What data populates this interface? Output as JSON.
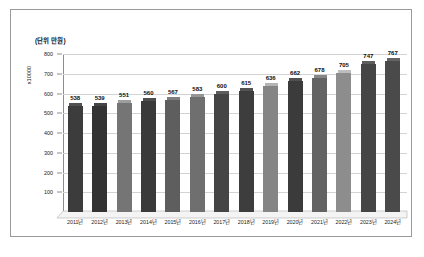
{
  "chart_data": {
    "type": "bar",
    "title": "",
    "unit_caption": "(단위 만원)",
    "ylabel": "x10000",
    "xlabel": "",
    "categories": [
      "2011년",
      "2012년",
      "2013년",
      "2014년",
      "2015년",
      "2016년",
      "2017년",
      "2018년",
      "2019년",
      "2020년",
      "2021년",
      "2022년",
      "2023년",
      "2024년"
    ],
    "values": [
      538,
      539,
      551,
      560,
      567,
      583,
      600,
      615,
      636,
      662,
      678,
      705,
      747,
      767
    ],
    "ylim": [
      0,
      800
    ],
    "yticks": [
      100,
      200,
      300,
      400,
      500,
      600,
      700,
      800
    ],
    "ytick_labels": [
      "100",
      "200",
      "300",
      "400",
      "500",
      "600",
      "700",
      "800"
    ],
    "grid": true,
    "legend": false,
    "style": "3d-column",
    "bar_colors": [
      "#3c3c3c",
      "#333333",
      "#757575",
      "#3a3a3a",
      "#5e5e5e",
      "#6f6f6f",
      "#454545",
      "#3d3d3d",
      "#858585",
      "#3b3b3b",
      "#636363",
      "#8d8d8d",
      "#454545",
      "#4a4a4a"
    ],
    "series": [
      {
        "name": "값",
        "values": [
          538,
          539,
          551,
          560,
          567,
          583,
          600,
          615,
          636,
          662,
          678,
          705,
          747,
          767
        ]
      }
    ]
  },
  "colors": {
    "frame_border": "#9a9a9a",
    "gridline": "#d3d3d3",
    "axis": "#8d8d8d",
    "plot_background": "#ffffff",
    "floor": "#f2f2f2",
    "text": "#101010"
  }
}
